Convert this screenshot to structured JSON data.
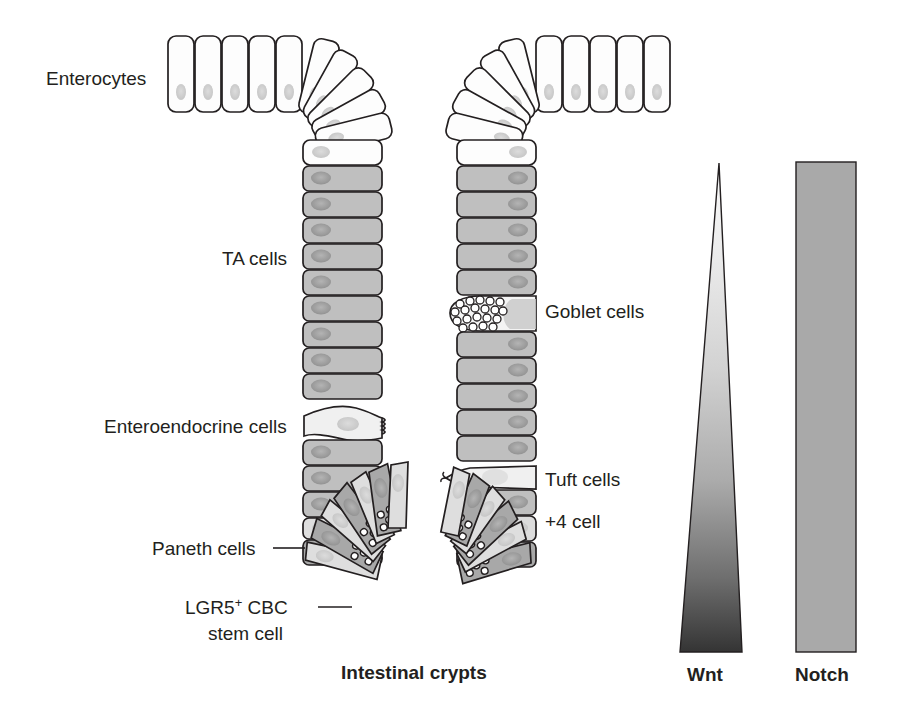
{
  "figure": {
    "title_caption": "Intestinal crypts"
  },
  "labels": {
    "enterocytes": "Enterocytes",
    "ta_cells": "TA cells",
    "goblet_cells": "Goblet cells",
    "enteroendocrine_cells": "Enteroendocrine cells",
    "tuft_cells": "Tuft cells",
    "plus_four_cell": "+4 cell",
    "paneth_cells": "Paneth cells",
    "lgr5_line1_main": "LGR5",
    "lgr5_line1_sup": "+",
    "lgr5_line1_rest": " CBC",
    "lgr5_line2": "stem cell",
    "caption": "Intestinal crypts"
  },
  "gradients": {
    "wnt": {
      "label": "Wnt",
      "shape": "triangle-apex-top",
      "top_value": "low",
      "bottom_value": "high",
      "color_top": "#f2f2f2",
      "color_bottom": "#3a3a3a"
    },
    "notch": {
      "label": "Notch",
      "shape": "rectangle-uniform",
      "top_value": "uniform",
      "bottom_value": "uniform",
      "color": "#a9a9a9"
    }
  },
  "colors": {
    "outline": "#231f20",
    "enterocyte_fill": "#fdfdfd",
    "ta_fill": "#bfbfbf",
    "paneth_fill": "#a8a8a8",
    "stem_fill": "#d8d8d8",
    "secretory_fill": "#ededed",
    "nucleus_fill": "#9a9a9a",
    "granule_fill": "#ffffff",
    "text": "#231f20"
  },
  "cell_types": [
    {
      "name": "Enterocytes",
      "region": "villus",
      "fill": "white"
    },
    {
      "name": "TA cells",
      "region": "upper crypt",
      "fill": "gray"
    },
    {
      "name": "Goblet cells",
      "region": "crypt wall right",
      "fill": "pale, mucin granules"
    },
    {
      "name": "Enteroendocrine cells",
      "region": "crypt wall left",
      "fill": "pale, pinched"
    },
    {
      "name": "Tuft cells",
      "region": "crypt wall right",
      "fill": "pale lens"
    },
    {
      "name": "+4 cell",
      "region": "crypt position +4",
      "fill": "light gray"
    },
    {
      "name": "Paneth cells",
      "region": "crypt base",
      "fill": "dark gray, granules"
    },
    {
      "name": "LGR5+ CBC stem cell",
      "region": "crypt base",
      "fill": "pale wedge"
    }
  ]
}
